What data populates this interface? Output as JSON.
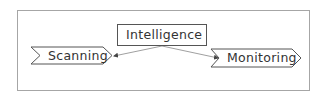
{
  "diagram": {
    "type": "flow",
    "colors": {
      "frame_border": "#a6a6a6",
      "node_border": "#555555",
      "connector": "#a0a0a0",
      "text": "#333333"
    },
    "nodes": [
      {
        "id": "intelligence",
        "label": "Intelligence",
        "shape": "rectangle"
      },
      {
        "id": "scanning",
        "label": "Scanning",
        "shape": "chevron"
      },
      {
        "id": "monitoring",
        "label": "Monitoring",
        "shape": "chevron"
      }
    ],
    "edges": [
      {
        "from": "intelligence",
        "to": "scanning",
        "arrow": "end"
      },
      {
        "from": "intelligence",
        "to": "monitoring",
        "arrow": "end"
      }
    ]
  }
}
